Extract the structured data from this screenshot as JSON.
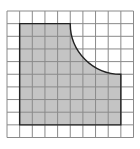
{
  "figure": {
    "type": "grid-area-diagram",
    "grid": {
      "columns": 10,
      "rows": 10,
      "origin_x": 7,
      "origin_y": 11,
      "cell_size": 12.65,
      "line_color": "#8a8a8a"
    },
    "shaded_region": {
      "fill": "#c4c4c4",
      "outline": "#222222",
      "col_start": 1,
      "col_end": 9,
      "row_start": 1,
      "row_end": 9,
      "quarter_circle_cutout": {
        "center_col": 9,
        "center_row": 1,
        "radius_cells": 4
      }
    }
  }
}
